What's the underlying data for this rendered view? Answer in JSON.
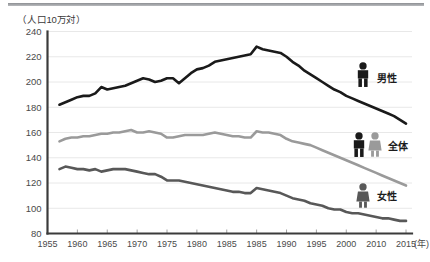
{
  "figure": {
    "axis_title": "（人口10万対）",
    "x_unit_label": "(年)",
    "background": "#ffffff"
  },
  "legend": [
    {
      "key": "male",
      "label": "男性",
      "icon": "male-pictogram",
      "color": "#1a1a1a"
    },
    {
      "key": "total",
      "label": "全体",
      "icon": "male-female-pictogram",
      "color": "#9a9a9a"
    },
    {
      "key": "female",
      "label": "女性",
      "icon": "female-pictogram",
      "color": "#585858"
    }
  ],
  "chart_data": {
    "type": "line",
    "title": "",
    "subtitle": "",
    "xlabel": "(年)",
    "ylabel": "（人口10万対）",
    "xlim": [
      1955,
      2016
    ],
    "ylim": [
      80,
      240
    ],
    "ytick_step": 20,
    "grid": true,
    "legend_position": "right-inline",
    "ytick_labels": [
      "80",
      "100",
      "120",
      "140",
      "160",
      "180",
      "200",
      "220",
      "240"
    ],
    "yticks": [
      80,
      100,
      120,
      140,
      160,
      180,
      200,
      220,
      240
    ],
    "xtick_labels": [
      "1955",
      "1960",
      "1965",
      "1970",
      "1975",
      "1980",
      "1985",
      "1985",
      "1990",
      "1995",
      "2000",
      "2010",
      "2015"
    ],
    "xticks": [
      1955,
      1960,
      1965,
      1970,
      1975,
      1980,
      1985,
      1990,
      1995,
      2000,
      2005,
      2010,
      2015
    ],
    "x": [
      1957,
      1958,
      1959,
      1960,
      1961,
      1962,
      1963,
      1964,
      1965,
      1966,
      1967,
      1968,
      1969,
      1970,
      1971,
      1972,
      1973,
      1974,
      1975,
      1976,
      1977,
      1978,
      1979,
      1980,
      1981,
      1982,
      1983,
      1984,
      1985,
      1986,
      1987,
      1988,
      1989,
      1990,
      1991,
      1992,
      1993,
      1994,
      1995,
      1996,
      1997,
      1998,
      1999,
      2000,
      2001,
      2002,
      2003,
      2004,
      2005,
      2006,
      2007,
      2008,
      2009,
      2010,
      2011,
      2012,
      2013,
      2014,
      2015
    ],
    "series": [
      {
        "name": "男性",
        "key": "male",
        "color": "#1a1a1a",
        "width": 2.6,
        "values": [
          182,
          184,
          186,
          188,
          189,
          189,
          191,
          196,
          194,
          195,
          196,
          197,
          199,
          201,
          203,
          202,
          200,
          201,
          203,
          203,
          199,
          203,
          207,
          210,
          211,
          213,
          216,
          217,
          218,
          219,
          220,
          221,
          222,
          228,
          226,
          225,
          224,
          223,
          220,
          216,
          213,
          209,
          206,
          203,
          200,
          197,
          194,
          192,
          189,
          187,
          185,
          183,
          181,
          179,
          177,
          175,
          173,
          170,
          167
        ]
      },
      {
        "name": "全体",
        "key": "total",
        "color": "#9a9a9a",
        "width": 2.6,
        "values": [
          153,
          155,
          156,
          156,
          157,
          157,
          158,
          159,
          159,
          160,
          160,
          161,
          162,
          160,
          160,
          161,
          160,
          159,
          156,
          156,
          157,
          158,
          158,
          158,
          158,
          159,
          160,
          159,
          158,
          157,
          157,
          156,
          156,
          161,
          160,
          160,
          159,
          158,
          155,
          153,
          152,
          151,
          150,
          148,
          146,
          144,
          142,
          140,
          138,
          136,
          134,
          132,
          130,
          128,
          126,
          124,
          122,
          120,
          118
        ]
      },
      {
        "name": "女性",
        "key": "female",
        "color": "#585858",
        "width": 2.6,
        "values": [
          131,
          133,
          132,
          131,
          131,
          130,
          131,
          129,
          130,
          131,
          131,
          131,
          130,
          129,
          128,
          127,
          127,
          125,
          122,
          122,
          122,
          121,
          120,
          119,
          118,
          117,
          116,
          115,
          114,
          113,
          113,
          112,
          112,
          116,
          115,
          114,
          113,
          112,
          110,
          108,
          107,
          106,
          104,
          103,
          102,
          100,
          99,
          99,
          97,
          96,
          96,
          95,
          94,
          93,
          92,
          92,
          91,
          90,
          90
        ]
      }
    ]
  }
}
